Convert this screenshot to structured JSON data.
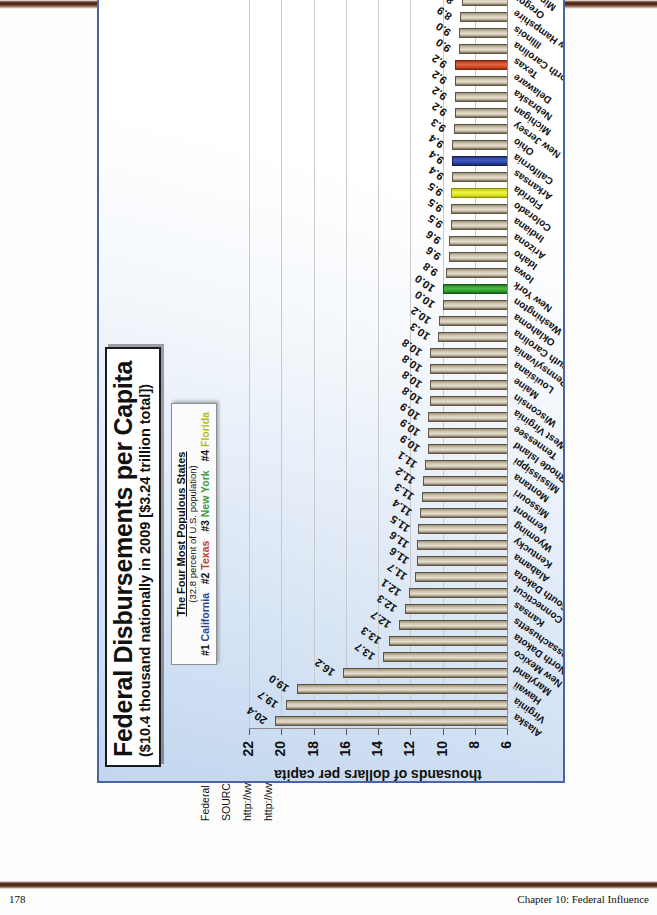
{
  "page": {
    "page_number": "178",
    "chapter_label": "Chapter 10: Federal Influence"
  },
  "slide": {
    "title_main": "Federal Disbursements per Capita",
    "title_sub": "($10.4 thousand nationally in 2009 [$3.24 trillion total])",
    "legend": {
      "title": "The Four Most Populous States",
      "note": "(32.8 percent of U.S. population)",
      "entries": [
        {
          "rank": "#1",
          "state": "California",
          "color": "#2b3f96"
        },
        {
          "rank": "#2",
          "state": "Texas",
          "color": "#c0432a"
        },
        {
          "rank": "#3",
          "state": "New York",
          "color": "#3f9a3c"
        },
        {
          "rank": "#4",
          "state": "Florida",
          "color": "#b2bf20"
        }
      ]
    }
  },
  "notes": [
    "Federal disbursements (funds distribution) include all domestic payments and purchases.",
    "SOURCES: U.S. Census Bureau Statistical Abstract of the United States: 2012, Table 479; U.S. Census Bureau, Consolidated Federal Funds Report, 2009, July 2010",
    "http://www.census.gov/compendia/statab/",
    "http://www.census.gov/govs/cffr"
  ],
  "chart_data": {
    "type": "bar",
    "title": "Federal Disbursements per Capita",
    "subtitle": "($10.4 thousand nationally in 2009 [$3.24 trillion total])",
    "orientation": "vertical",
    "xlabel": "",
    "ylabel": "thousands of dollars per capita",
    "ylim": [
      6,
      22
    ],
    "yticks": [
      6,
      8,
      10,
      12,
      14,
      16,
      18,
      20,
      22
    ],
    "grid": true,
    "legend_position": "top-center",
    "highlight_colors": {
      "California": "#2b3f96",
      "Texas": "#c0432a",
      "New York": "#3f9a3c",
      "Florida": "#b2bf20"
    },
    "categories": [
      "Alaska",
      "Virginia",
      "Hawaii",
      "Maryland",
      "New Mexico",
      "North Dakota",
      "Massachusetts",
      "Kansas",
      "Connecticut",
      "South Dakota",
      "Alabama",
      "Kentucky",
      "Wyoming",
      "Vermont",
      "Missouri",
      "Montana",
      "Mississippi",
      "Rhode Island",
      "Tennessee",
      "West Virginia",
      "Wisconsin",
      "Maine",
      "Louisiana",
      "Pennsylvania",
      "South Carolina",
      "Oklahoma",
      "Washington",
      "New York",
      "Iowa",
      "Idaho",
      "Arizona",
      "Indiana",
      "Colorado",
      "Florida",
      "Arkansas",
      "California",
      "Ohio",
      "New Jersey",
      "Michigan",
      "Nebraska",
      "Delaware",
      "Texas",
      "North Carolina",
      "Illinois",
      "New Hampshire",
      "Oregon",
      "Minnesota",
      "Georgia",
      "Utah",
      "Nevada"
    ],
    "values": [
      20.4,
      19.7,
      19.0,
      16.2,
      13.7,
      13.3,
      12.7,
      12.3,
      12.1,
      11.7,
      11.6,
      11.6,
      11.5,
      11.4,
      11.3,
      11.2,
      11.1,
      10.9,
      10.9,
      10.9,
      10.8,
      10.8,
      10.8,
      10.8,
      10.3,
      10.2,
      10.0,
      10.0,
      9.8,
      9.6,
      9.6,
      9.5,
      9.5,
      9.5,
      9.4,
      9.4,
      9.4,
      9.3,
      9.2,
      9.2,
      9.2,
      9.2,
      9.0,
      9.0,
      8.9,
      8.8,
      8.7,
      8.5,
      7.4,
      7.1
    ],
    "value_labels": [
      "20.4",
      "19.7",
      "19.0",
      "16.2",
      "13.7",
      "13.3",
      "12.7",
      "12.3",
      "12.1",
      "11.7",
      "11.6",
      "11.6",
      "11.5",
      "11.4",
      "11.3",
      "11.2",
      "11.1",
      "10.9",
      "10.9",
      "10.9",
      "10.8",
      "10.8",
      "10.8",
      "10.8",
      "10.3",
      "10.2",
      "10.0",
      "10.0",
      "9.8",
      "9.6",
      "9.6",
      "9.5",
      "9.5",
      "9.5",
      "9.4",
      "9.4",
      "9.4",
      "9.3",
      "9.2",
      "9.2",
      "9.2",
      "9.2",
      "9.0",
      "9.0",
      "8.9",
      "8.8",
      "8.7",
      "8.5",
      "7.4",
      "7.1"
    ],
    "highlighted": {
      "New York": "ny",
      "Florida": "fl",
      "California": "ca",
      "Texas": "tx"
    }
  }
}
